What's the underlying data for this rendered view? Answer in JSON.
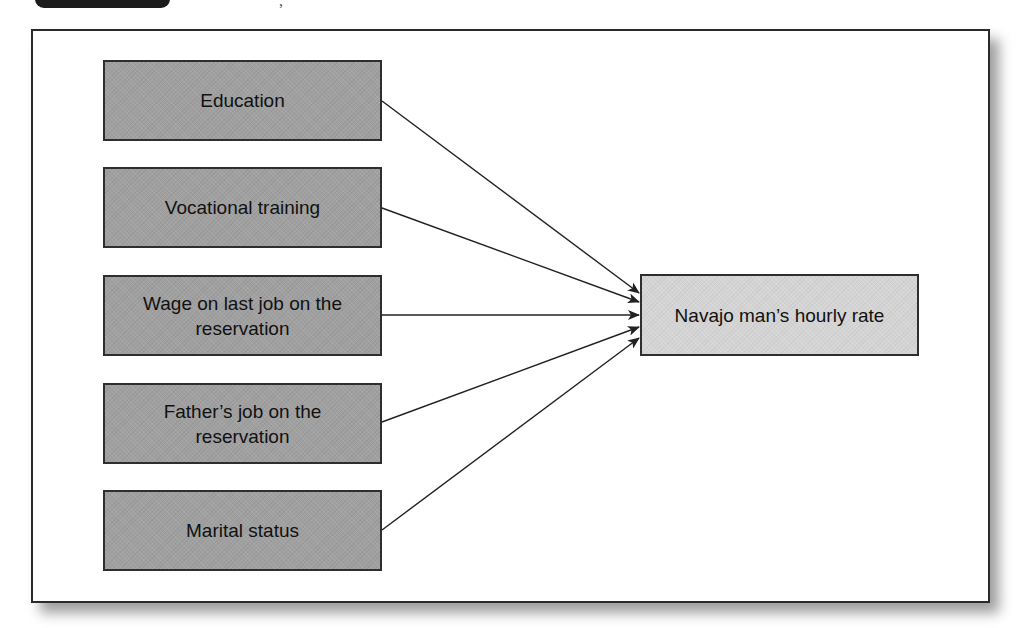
{
  "header": {
    "tab_color": "#1c1c1c",
    "fragment_text": ","
  },
  "diagram": {
    "type": "path-diagram",
    "colors": {
      "source_fill": "#a0a0a0",
      "target_fill": "#d4d4d4",
      "border": "#2e2e2e",
      "arrow": "#222222",
      "text": "#111111"
    },
    "sources": [
      {
        "id": "education",
        "label": "Education"
      },
      {
        "id": "vocational-training",
        "label": "Vocational training"
      },
      {
        "id": "wage-last-job",
        "label": "Wage on last job on the reservation"
      },
      {
        "id": "fathers-job",
        "label": "Father’s job on the reservation"
      },
      {
        "id": "marital-status",
        "label": "Marital status"
      }
    ],
    "target": {
      "id": "hourly-rate",
      "label": "Navajo man’s hourly rate"
    },
    "edges": [
      {
        "from": "education",
        "to": "hourly-rate"
      },
      {
        "from": "vocational-training",
        "to": "hourly-rate"
      },
      {
        "from": "wage-last-job",
        "to": "hourly-rate"
      },
      {
        "from": "fathers-job",
        "to": "hourly-rate"
      },
      {
        "from": "marital-status",
        "to": "hourly-rate"
      }
    ]
  }
}
